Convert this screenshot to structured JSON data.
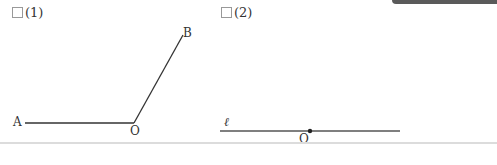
{
  "problems": [
    {
      "number": "(1)",
      "points": {
        "A": "A",
        "O": "O",
        "B": "B"
      },
      "description": "Angle AOB with ray OA horizontal left and ray OB up-right"
    },
    {
      "number": "(2)",
      "line_label": "ℓ",
      "points": {
        "O": "O"
      },
      "description": "Line ℓ with point O on it"
    }
  ],
  "colors": {
    "line": "#333333",
    "checkbox_border": "#999999",
    "top_bar": "#5a5a5a",
    "divider": "#dcdcdc"
  }
}
